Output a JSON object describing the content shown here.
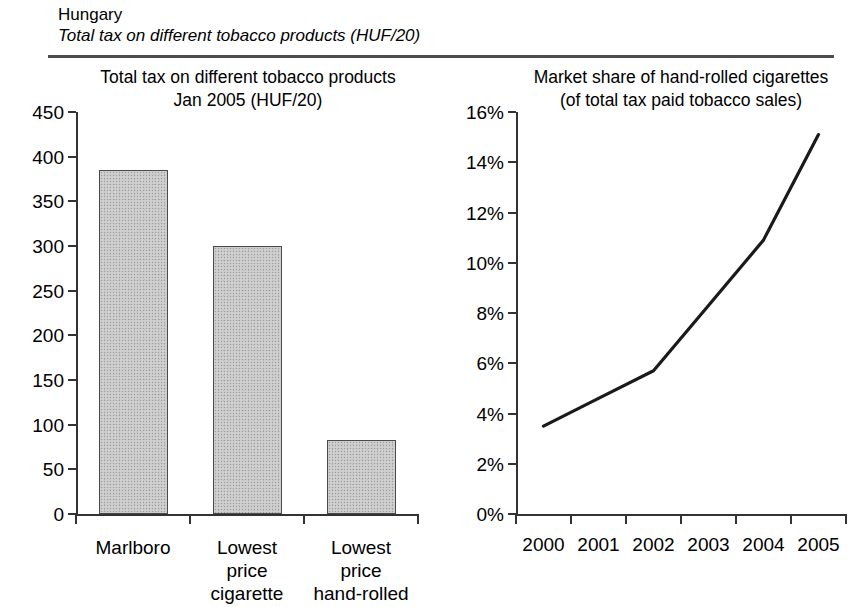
{
  "header": {
    "country": "Hungary",
    "subtitle": "Total tax on different tobacco products (HUF/20)"
  },
  "bar_panel": {
    "title_line1": "Total tax on different tobacco products",
    "title_line2": "Jan 2005 (HUF/20)"
  },
  "line_panel": {
    "title_line1": "Market share of hand-rolled cigarettes",
    "title_line2": "(of total tax paid tobacco sales)"
  },
  "colors": {
    "bar_fill": "#c9c9c9",
    "bar_border": "#4a4a4a",
    "line": "#1a1a1a",
    "axis": "#333333",
    "rule": "#4d4d4d"
  },
  "chart_data": [
    {
      "type": "bar",
      "title": "Total tax on different tobacco products Jan 2005 (HUF/20)",
      "xlabel": "",
      "ylabel": "",
      "ylim": [
        0,
        450
      ],
      "yticks": [
        0,
        50,
        100,
        150,
        200,
        250,
        300,
        350,
        400,
        450
      ],
      "ytick_labels": [
        "0",
        "50",
        "100",
        "150",
        "200",
        "250",
        "300",
        "350",
        "400",
        "450"
      ],
      "categories": [
        "Marlboro",
        "Lowest price cigarette",
        "Lowest price hand-rolled"
      ],
      "category_lines": [
        [
          "Marlboro"
        ],
        [
          "Lowest",
          "price",
          "cigarette"
        ],
        [
          "Lowest",
          "price",
          "hand-rolled"
        ]
      ],
      "values": [
        385,
        300,
        83
      ],
      "grid": false,
      "legend": "none"
    },
    {
      "type": "line",
      "title": "Market share of hand-rolled cigarettes (of total tax paid tobacco sales)",
      "xlabel": "",
      "ylabel": "",
      "ylim": [
        0,
        16
      ],
      "yticks": [
        0,
        2,
        4,
        6,
        8,
        10,
        12,
        14,
        16
      ],
      "ytick_labels": [
        "0%",
        "2%",
        "4%",
        "6%",
        "8%",
        "10%",
        "12%",
        "14%",
        "16%"
      ],
      "x": [
        2000,
        2001,
        2002,
        2003,
        2004,
        2005
      ],
      "xtick_labels": [
        "2000",
        "2001",
        "2002",
        "2003",
        "2004",
        "2005"
      ],
      "values": [
        3.5,
        4.6,
        5.7,
        8.3,
        10.9,
        15.1
      ],
      "grid": false,
      "legend": "none"
    }
  ]
}
